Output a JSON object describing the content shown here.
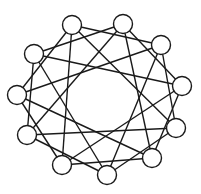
{
  "diagram": {
    "type": "circulant-graph",
    "node_count": 11,
    "node_radius": 9.5,
    "colors": {
      "stroke": "#1a1a1a",
      "node_fill": "#ffffff",
      "background": "#ffffff"
    },
    "nodes": [
      {
        "id": 0,
        "x": 72,
        "y": 25
      },
      {
        "id": 1,
        "x": 123,
        "y": 24
      },
      {
        "id": 2,
        "x": 161,
        "y": 45
      },
      {
        "id": 3,
        "x": 182,
        "y": 86
      },
      {
        "id": 4,
        "x": 176,
        "y": 128
      },
      {
        "id": 5,
        "x": 152,
        "y": 158
      },
      {
        "id": 6,
        "x": 107,
        "y": 175
      },
      {
        "id": 7,
        "x": 62,
        "y": 165
      },
      {
        "id": 8,
        "x": 27,
        "y": 135
      },
      {
        "id": 9,
        "x": 17,
        "y": 95
      },
      {
        "id": 10,
        "x": 34,
        "y": 54
      }
    ],
    "edge_offsets": [
      2,
      4
    ],
    "edges": [
      [
        0,
        2
      ],
      [
        1,
        3
      ],
      [
        2,
        4
      ],
      [
        3,
        5
      ],
      [
        4,
        6
      ],
      [
        5,
        7
      ],
      [
        6,
        8
      ],
      [
        7,
        9
      ],
      [
        8,
        10
      ],
      [
        9,
        0
      ],
      [
        10,
        1
      ],
      [
        0,
        4
      ],
      [
        1,
        5
      ],
      [
        2,
        6
      ],
      [
        3,
        7
      ],
      [
        4,
        8
      ],
      [
        5,
        9
      ],
      [
        6,
        10
      ],
      [
        7,
        0
      ],
      [
        8,
        1
      ],
      [
        9,
        2
      ],
      [
        10,
        3
      ]
    ]
  }
}
